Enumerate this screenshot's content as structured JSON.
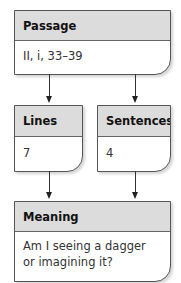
{
  "diagram": {
    "passage": {
      "title": "Passage",
      "value": "II, i, 33–39"
    },
    "lines": {
      "title": "Lines",
      "value": "7"
    },
    "sentences": {
      "title": "Sentences",
      "value": "4"
    },
    "meaning": {
      "title": "Meaning",
      "value": "Am I seeing a dagger or imagining it?"
    }
  },
  "colors": {
    "header_bg": "#dcdcdc",
    "border": "#555555",
    "arrow": "#222222"
  },
  "connectors": [
    {
      "from": "passage",
      "to": "lines"
    },
    {
      "from": "passage",
      "to": "sentences"
    },
    {
      "from": "lines",
      "to": "meaning"
    },
    {
      "from": "sentences",
      "to": "meaning"
    }
  ]
}
